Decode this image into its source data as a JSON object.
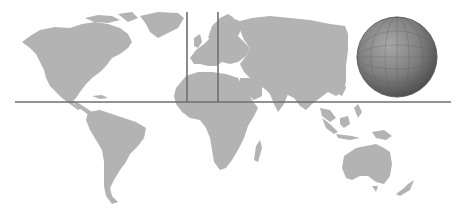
{
  "map": {
    "type": "world-map",
    "land_color": "#b3b3b3",
    "background_color": "#ffffff",
    "line_color": "#6e6e6e"
  },
  "lines": {
    "horizontal": {
      "x1": 15,
      "x2": 451,
      "y": 102
    },
    "vertical": [
      {
        "x": 187,
        "y1": 12,
        "y2": 102
      },
      {
        "x": 218,
        "y1": 12,
        "y2": 102
      }
    ]
  },
  "globe": {
    "cx": 397,
    "cy": 57,
    "r": 40,
    "light_color": "#9a9a9a",
    "dark_color": "#4e4e4e"
  }
}
